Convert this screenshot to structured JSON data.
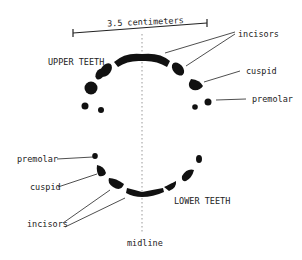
{
  "diagram": {
    "scale_label": "3.5 centimeters",
    "upper_label": "UPPER TEETH",
    "lower_label": "LOWER TEETH",
    "midline_label": "midline",
    "upper_annotations": {
      "incisors": "incisors",
      "cuspid": "cuspid",
      "premolar": "premolar"
    },
    "lower_annotations": {
      "premolar": "premolar",
      "cuspid": "cuspid",
      "incisors": "incisors"
    },
    "colors": {
      "ink": "#111111",
      "background": "#ffffff",
      "midline": "#999999"
    }
  }
}
